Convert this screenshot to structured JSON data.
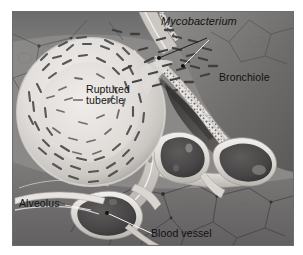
{
  "figure": {
    "style": "grayscale medical illustration",
    "border_color": "#6d6d6d",
    "background_color": "#ffffff"
  },
  "labels": {
    "mycobacterium": "Mycobacterium",
    "bronchiole": "Bronchiole",
    "ruptured_tubercle_line1": "Ruptured",
    "ruptured_tubercle_line2": "tubercle",
    "alveolus": "Alveolus",
    "blood_vessel": "Blood vessel"
  },
  "structures": [
    {
      "name": "ruptured-tubercle",
      "description": "large pale sphere with dense ring of bacilli"
    },
    {
      "name": "bronchiole",
      "description": "airway with ciliated epithelium and dark lumen"
    },
    {
      "name": "alveolus",
      "description": "thin-walled air sac"
    },
    {
      "name": "blood-vessel",
      "description": "dark lumen vessels with pale walls"
    },
    {
      "name": "mycobacterium",
      "description": "rod-shaped bacilli spreading into airway"
    }
  ],
  "colors": {
    "tissue_dark": "#6f6f6f",
    "tissue_mid": "#8d8d8d",
    "tissue_light": "#cfcccb",
    "tubercle_fill": "#e4e1de",
    "vessel_lumen": "#4a4a4a",
    "bacilli": "#4b4b4b",
    "leader_dark": "#1b1b1b",
    "leader_light": "#f2f2f2"
  }
}
